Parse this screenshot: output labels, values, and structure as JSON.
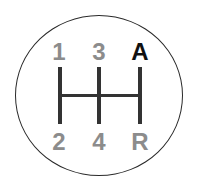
{
  "shift_pattern": {
    "top_labels": [
      "1",
      "3",
      "A"
    ],
    "bottom_labels": [
      "2",
      "4",
      "R"
    ],
    "colors": {
      "gear_label": "#8c8c8c",
      "highlighted_label": "#111111",
      "lines": "#333333",
      "outline": "#2a2a2a"
    }
  }
}
